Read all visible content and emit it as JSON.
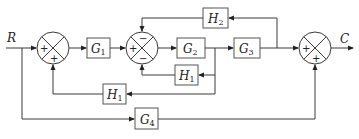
{
  "diagram": {
    "type": "control-system-block-diagram",
    "input_signal": "R",
    "output_signal": "C",
    "blocks": [
      {
        "id": "G1",
        "name": "G",
        "sub": "1"
      },
      {
        "id": "G2",
        "name": "G",
        "sub": "2"
      },
      {
        "id": "G3",
        "name": "G",
        "sub": "3"
      },
      {
        "id": "G4",
        "name": "G",
        "sub": "4"
      },
      {
        "id": "H1_inner",
        "name": "H",
        "sub": "1"
      },
      {
        "id": "H1_outer",
        "name": "H",
        "sub": "1"
      },
      {
        "id": "H2",
        "name": "H",
        "sub": "2"
      }
    ],
    "summing_junctions": [
      {
        "id": "S1",
        "signs": {
          "left": "+",
          "bottom": "+"
        }
      },
      {
        "id": "S2",
        "signs": {
          "left": "+",
          "top": "−",
          "bottom": "−"
        }
      },
      {
        "id": "S3",
        "signs": {
          "left": "+",
          "bottom": "+"
        }
      }
    ],
    "connections": [
      "R → S1(+)",
      "S1 → G1 → S2(+)",
      "S2 → G2 → G3 → S3(+)",
      "G3 output → H2 → S2(−)",
      "G2 output → H1 → S2(−)",
      "G2 output → H1 → S1(+)",
      "R → G4 → S3(+)",
      "S3 → C"
    ]
  }
}
